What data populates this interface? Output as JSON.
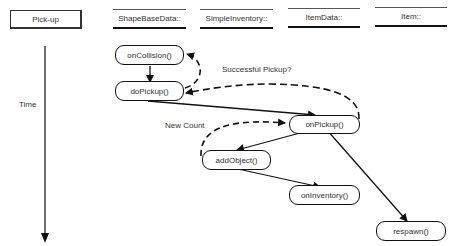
{
  "actor": {
    "label": "Pick-up"
  },
  "lanes": [
    {
      "label": "ShapeBaseData::"
    },
    {
      "label": "SimpleInventory::"
    },
    {
      "label": "ItemData::"
    },
    {
      "label": "Item::"
    }
  ],
  "time_axis": {
    "label": "Time"
  },
  "nodes": {
    "onCollision": "onCollision()",
    "doPickup": "doPickup()",
    "onPickup": "onPickup()",
    "addObject": "addObject()",
    "onInventory": "onInventory()",
    "respawn": "respawn()"
  },
  "annotations": {
    "successful_pickup": "Successful Pickup?",
    "new_count": "New Count"
  }
}
